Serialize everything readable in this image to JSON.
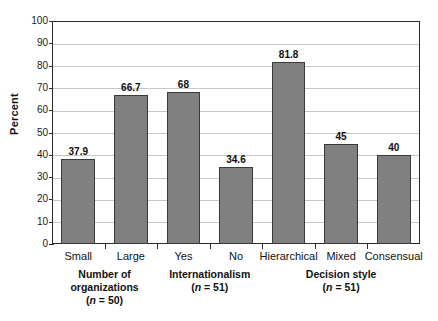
{
  "chart_data": {
    "type": "bar",
    "title": "",
    "xlabel": "",
    "ylabel": "Percent",
    "ylim": [
      0,
      100
    ],
    "ytick_step": 10,
    "yticks": [
      100,
      90,
      80,
      70,
      60,
      50,
      40,
      30,
      20,
      10,
      0
    ],
    "grid": true,
    "legend": "none",
    "bar_color": "#808080",
    "bar_border_color": "#3a3a3a",
    "categories": [
      "Small",
      "Large",
      "Yes",
      "No",
      "Hierarchical",
      "Mixed",
      "Consensual"
    ],
    "values": [
      37.9,
      66.7,
      68,
      34.6,
      81.8,
      45,
      40
    ],
    "value_labels": [
      "37.9",
      "66.7",
      "68",
      "34.6",
      "81.8",
      "45",
      "40"
    ],
    "groups": [
      {
        "name": "Number of organizations",
        "line1": "Number of",
        "line2": "organizations",
        "n_prefix": "(",
        "n_italic": "n",
        "n_rest": " = 50)",
        "n": 50,
        "members": [
          "Small",
          "Large"
        ]
      },
      {
        "name": "Internationalism",
        "line1": "Internationalism",
        "line2": "",
        "n_prefix": "(",
        "n_italic": "n",
        "n_rest": " = 51)",
        "n": 51,
        "members": [
          "Yes",
          "No"
        ]
      },
      {
        "name": "Decision style",
        "line1": "Decision style",
        "line2": "",
        "n_prefix": "(",
        "n_italic": "n",
        "n_rest": " = 51)",
        "n": 51,
        "members": [
          "Hierarchical",
          "Mixed",
          "Consensual"
        ]
      }
    ]
  },
  "axis": {
    "y_title": "Percent",
    "y_labels": [
      "100",
      "90",
      "80",
      "70",
      "60",
      "50",
      "40",
      "30",
      "20",
      "10",
      "0"
    ]
  }
}
